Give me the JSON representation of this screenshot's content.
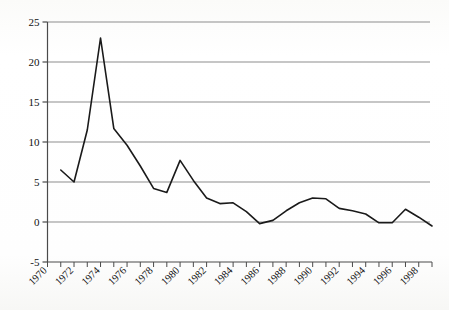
{
  "chart_data": {
    "type": "line",
    "title": "",
    "subtitle": "",
    "xlabel": "",
    "ylabel": "",
    "xlim": [
      1970,
      1999
    ],
    "ylim": [
      -5,
      25
    ],
    "yticks": [
      -5,
      0,
      5,
      10,
      15,
      20,
      25
    ],
    "ytick_labels": [
      "-5",
      "0",
      "5",
      "10",
      "15",
      "20",
      "25"
    ],
    "xticks": [
      1970,
      1971,
      1972,
      1973,
      1974,
      1975,
      1976,
      1977,
      1978,
      1979,
      1980,
      1981,
      1982,
      1983,
      1984,
      1985,
      1986,
      1987,
      1988,
      1989,
      1990,
      1991,
      1992,
      1993,
      1994,
      1995,
      1996,
      1997,
      1998,
      1999
    ],
    "xtick_labels": [
      "1970",
      "1972",
      "1974",
      "1976",
      "1978",
      "1980",
      "1982",
      "1984",
      "1986",
      "1988",
      "1990",
      "1992",
      "1994",
      "1996",
      "1998"
    ],
    "xtick_label_years": [
      1970,
      1972,
      1974,
      1976,
      1978,
      1980,
      1982,
      1984,
      1986,
      1988,
      1990,
      1992,
      1994,
      1996,
      1998
    ],
    "xtick_rotation": 45,
    "grid": "horizontal",
    "gridlines_at": [
      0,
      5,
      10,
      15,
      20,
      25
    ],
    "legend": "none",
    "line_color": "#1a1a1a",
    "grid_color": "#8d8d8d",
    "axis_color": "#4a4a4a",
    "background_color": "#fdfdfc",
    "series": [
      {
        "name": "series-1",
        "x": [
          1971,
          1972,
          1973,
          1974,
          1975,
          1976,
          1977,
          1978,
          1979,
          1980,
          1981,
          1982,
          1983,
          1984,
          1985,
          1986,
          1987,
          1988,
          1989,
          1990,
          1991,
          1992,
          1993,
          1994,
          1995,
          1996,
          1997,
          1998,
          1999
        ],
        "values": [
          6.5,
          5.0,
          11.5,
          23.0,
          11.7,
          9.6,
          7.0,
          4.2,
          3.7,
          7.7,
          5.2,
          3.0,
          2.3,
          2.4,
          1.3,
          -0.2,
          0.2,
          1.4,
          2.4,
          3.0,
          2.9,
          1.7,
          1.4,
          1.0,
          -0.1,
          -0.1,
          1.6,
          0.6,
          -0.5
        ]
      }
    ]
  },
  "plot": {
    "x_axis_name": "year-axis",
    "y_axis_name": "value-axis"
  }
}
